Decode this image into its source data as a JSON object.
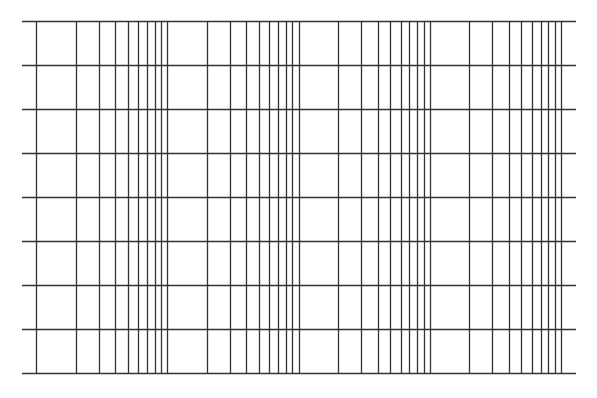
{
  "caption": {
    "text": "",
    "note": "clipped caption line at top edge; only descenders visible"
  },
  "chart_data": {
    "type": "semilog-grid",
    "title": "",
    "xlabel": "",
    "ylabel": "",
    "x_scale": "log",
    "x_decades": 4,
    "x_cycle_minor_ticks": [
      1,
      2,
      3,
      4,
      5,
      6,
      7,
      8,
      9,
      10
    ],
    "y_scale": "linear",
    "y_divisions": 8,
    "grid": true,
    "legend": null,
    "series": []
  },
  "layout": {
    "plot_left": 22,
    "plot_right": 576,
    "plot_top": 21,
    "plot_bottom": 373,
    "decade_start": 36,
    "decade_width": 131.25,
    "vertical_line_top": 21,
    "vertical_line_bottom": 373,
    "line_color": "#333333",
    "line_width": 1.3
  }
}
